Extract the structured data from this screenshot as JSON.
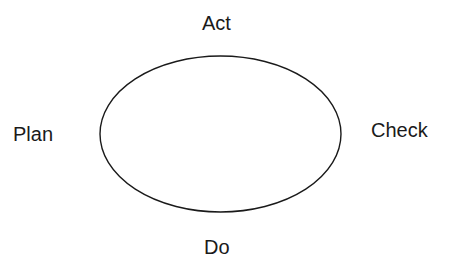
{
  "diagram": {
    "type": "cycle",
    "shape": "ellipse",
    "labels": {
      "top": "Act",
      "left": "Plan",
      "right": "Check",
      "bottom": "Do"
    },
    "stroke_color": "#1a1a1a",
    "background": "#ffffff"
  }
}
